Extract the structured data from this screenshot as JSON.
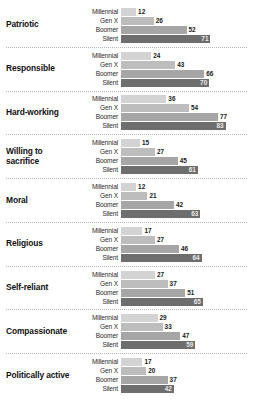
{
  "chart_data": {
    "type": "bar",
    "title": "",
    "xlabel": "",
    "ylabel": "",
    "xlim": [
      0,
      100
    ],
    "grid": false,
    "legend_position": "none",
    "orientation": "horizontal",
    "categories": [
      "Patriotic",
      "Responsible",
      "Hard-working",
      "Willing to sacrifice",
      "Moral",
      "Religious",
      "Self-reliant",
      "Compassionate",
      "Politically active"
    ],
    "series": [
      {
        "name": "Millennial",
        "values": [
          12,
          24,
          36,
          15,
          12,
          17,
          27,
          29,
          17
        ]
      },
      {
        "name": "Gen X",
        "values": [
          26,
          43,
          54,
          27,
          21,
          27,
          37,
          33,
          20
        ]
      },
      {
        "name": "Boomer",
        "values": [
          52,
          66,
          77,
          45,
          42,
          46,
          51,
          47,
          37
        ]
      },
      {
        "name": "Silent",
        "values": [
          71,
          70,
          83,
          61,
          63,
          64,
          65,
          59,
          42
        ]
      }
    ],
    "colors": {
      "millennial": "#d3d3d3",
      "genx": "#bdbdbd",
      "boomer": "#a6a6a6",
      "silent": "#6e6e6e"
    },
    "groups": [
      {
        "category": "Patriotic",
        "bars": [
          {
            "label": "Millennial",
            "value": 12
          },
          {
            "label": "Gen X",
            "value": 26
          },
          {
            "label": "Boomer",
            "value": 52
          },
          {
            "label": "Silent",
            "value": 71
          }
        ]
      },
      {
        "category": "Responsible",
        "bars": [
          {
            "label": "Millennial",
            "value": 24
          },
          {
            "label": "Gen X",
            "value": 43
          },
          {
            "label": "Boomer",
            "value": 66
          },
          {
            "label": "Silent",
            "value": 70
          }
        ]
      },
      {
        "category": "Hard-working",
        "bars": [
          {
            "label": "Millennial",
            "value": 36
          },
          {
            "label": "Gen X",
            "value": 54
          },
          {
            "label": "Boomer",
            "value": 77
          },
          {
            "label": "Silent",
            "value": 83
          }
        ]
      },
      {
        "category": "Willing to sacrifice",
        "bars": [
          {
            "label": "Millennial",
            "value": 15
          },
          {
            "label": "Gen X",
            "value": 27
          },
          {
            "label": "Boomer",
            "value": 45
          },
          {
            "label": "Silent",
            "value": 61
          }
        ]
      },
      {
        "category": "Moral",
        "bars": [
          {
            "label": "Millennial",
            "value": 12
          },
          {
            "label": "Gen X",
            "value": 21
          },
          {
            "label": "Boomer",
            "value": 42
          },
          {
            "label": "Silent",
            "value": 63
          }
        ]
      },
      {
        "category": "Religious",
        "bars": [
          {
            "label": "Millennial",
            "value": 17
          },
          {
            "label": "Gen X",
            "value": 27
          },
          {
            "label": "Boomer",
            "value": 46
          },
          {
            "label": "Silent",
            "value": 64
          }
        ]
      },
      {
        "category": "Self-reliant",
        "bars": [
          {
            "label": "Millennial",
            "value": 27
          },
          {
            "label": "Gen X",
            "value": 37
          },
          {
            "label": "Boomer",
            "value": 51
          },
          {
            "label": "Silent",
            "value": 65
          }
        ]
      },
      {
        "category": "Compassionate",
        "bars": [
          {
            "label": "Millennial",
            "value": 29
          },
          {
            "label": "Gen X",
            "value": 33
          },
          {
            "label": "Boomer",
            "value": 47
          },
          {
            "label": "Silent",
            "value": 59
          }
        ]
      },
      {
        "category": "Politically active",
        "bars": [
          {
            "label": "Millennial",
            "value": 17
          },
          {
            "label": "Gen X",
            "value": 20
          },
          {
            "label": "Boomer",
            "value": 37
          },
          {
            "label": "Silent",
            "value": 42
          }
        ]
      }
    ]
  }
}
